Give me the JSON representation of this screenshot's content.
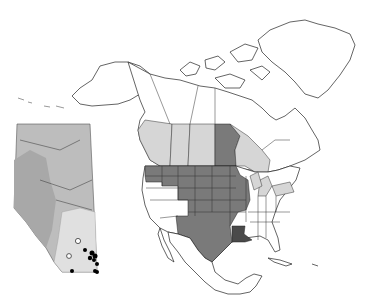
{
  "map": {
    "title": "",
    "region": "North America",
    "inset": "Alberta",
    "colors": {
      "background": "#ffffff",
      "outline": "#222222",
      "dark_fill": "#7a7a7a",
      "darkest_fill": "#4a4a4a",
      "light_fill": "#d6d6d6",
      "inset_base": "#bdbdbd",
      "inset_mid": "#a8a8a8",
      "inset_light": "#e0e0e0",
      "point_filled": "#000000",
      "point_open": "#ffffff"
    },
    "legend": {
      "dark": "Primary range states/provinces",
      "light": "Secondary range states/provinces",
      "darkest": "Distinct occurrence"
    },
    "shaded_regions": {
      "dark": [
        "Washington",
        "Oregon",
        "Idaho",
        "Montana",
        "Wyoming",
        "North Dakota",
        "South Dakota",
        "Nebraska",
        "Minnesota",
        "Iowa",
        "Wisconsin",
        "Illinois",
        "Missouri",
        "Kansas",
        "Colorado",
        "Utah",
        "New Mexico",
        "Oklahoma",
        "Texas",
        "Manitoba"
      ],
      "darkest": [
        "Louisiana"
      ],
      "light": [
        "British Columbia",
        "Alberta",
        "Saskatchewan",
        "Ontario",
        "Michigan",
        "Ohio",
        "Pennsylvania",
        "New York"
      ]
    },
    "inset_points": {
      "filled": 9,
      "open": 2
    }
  }
}
